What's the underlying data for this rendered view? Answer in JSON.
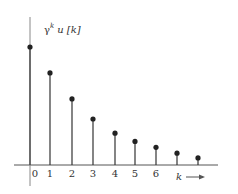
{
  "chart_data": {
    "type": "stem",
    "ylabel": "γ^k u [k]",
    "xlabel": "k",
    "categories": [
      "0",
      "1",
      "2",
      "3",
      "4",
      "5",
      "6",
      "7",
      "8"
    ],
    "x": [
      0,
      1,
      2,
      3,
      4,
      5,
      6,
      7,
      8
    ],
    "values": [
      1.0,
      0.78,
      0.56,
      0.39,
      0.27,
      0.2,
      0.15,
      0.1,
      0.06
    ],
    "tick_labels": [
      "0",
      "1",
      "2",
      "3",
      "4",
      "5",
      "6"
    ],
    "grid": false,
    "legend": null
  },
  "labels": {
    "y_gamma": "γ",
    "y_sup": "k",
    "y_rest": "u [k]",
    "x_k": "k"
  },
  "colors": {
    "stem": "#333333",
    "axis": "#444444"
  }
}
